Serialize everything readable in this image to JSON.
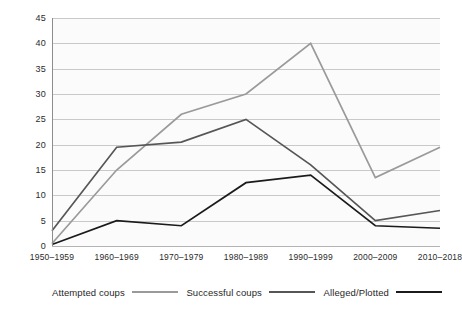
{
  "chart_data": {
    "type": "line",
    "title": "",
    "xlabel": "",
    "ylabel": "",
    "ylim": [
      0,
      45
    ],
    "yticks": [
      0,
      5,
      10,
      15,
      20,
      25,
      30,
      35,
      40,
      45
    ],
    "grid": true,
    "legend_position": "bottom",
    "categories": [
      "1950–1959",
      "1960–1969",
      "1970–1979",
      "1980–1989",
      "1990–1999",
      "2000–2009",
      "2010–2018"
    ],
    "series": [
      {
        "name": "Attempted coups",
        "color": "#9a9a9a",
        "values": [
          0.5,
          15,
          26,
          30,
          40,
          13.5,
          19.5
        ]
      },
      {
        "name": "Successful coups",
        "color": "#565656",
        "values": [
          3,
          19.5,
          20.5,
          25,
          16,
          5,
          7
        ]
      },
      {
        "name": "Alleged/Plotted",
        "color": "#1b1b1b",
        "values": [
          0.3,
          5,
          4,
          12.5,
          14,
          4,
          3.5
        ]
      }
    ]
  },
  "colors": {
    "background": "#ffffff",
    "plot_background": "#fbfbfb",
    "gridline": "#c9c9c9",
    "axis": "#8d8d8d",
    "tick_text": "#2b2b2b",
    "legend_text": "#1f1f1f"
  }
}
